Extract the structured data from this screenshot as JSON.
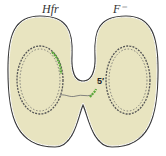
{
  "diagram": {
    "labels": {
      "donor_cell": "Hfr",
      "recipient_cell": "F⁻",
      "strand_end": "5′"
    },
    "colors": {
      "cytoplasm": "#e8e4c0",
      "membrane": "#3a3a3a",
      "chromosome": "#555555",
      "transferred_dna": "#5aa83a"
    }
  }
}
